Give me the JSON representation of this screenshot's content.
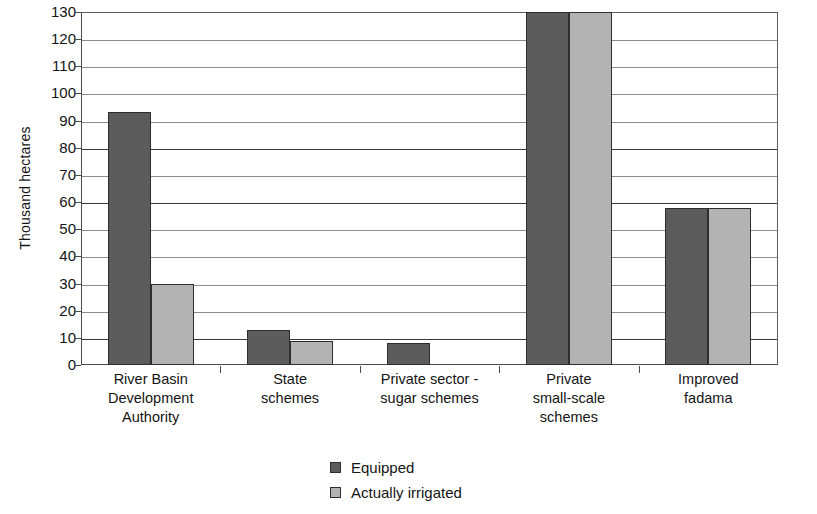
{
  "chart_data": {
    "type": "bar",
    "title": "",
    "xlabel": "",
    "ylabel": "Thousand hectares",
    "ylim": [
      0,
      130
    ],
    "ytick_step": 10,
    "yticks": [
      130,
      120,
      110,
      100,
      90,
      80,
      70,
      60,
      50,
      40,
      30,
      20,
      10,
      0
    ],
    "grid": true,
    "legend_position": "bottom-center",
    "categories": [
      "River Basin Development Authority",
      "State schemes",
      "Private sector - sugar schemes",
      "Private small-scale schemes",
      "Improved fadama"
    ],
    "category_lines": [
      [
        "River Basin",
        "Development",
        "Authority"
      ],
      [
        "State",
        "schemes"
      ],
      [
        "Private sector -",
        "sugar schemes"
      ],
      [
        "Private",
        "small-scale",
        "schemes"
      ],
      [
        "Improved",
        "fadama"
      ]
    ],
    "series": [
      {
        "name": "Equipped",
        "color": "#5c5c5c",
        "values": [
          93,
          13,
          8,
          130,
          58
        ]
      },
      {
        "name": "Actually irrigated",
        "color": "#b3b3b3",
        "values": [
          30,
          9,
          null,
          130,
          58
        ]
      }
    ]
  },
  "axis": {
    "y_title": "Thousand hectares",
    "y_tick_labels": [
      "130",
      "120",
      "110",
      "100",
      "90",
      "80",
      "70",
      "60",
      "50",
      "40",
      "30",
      "20",
      "10",
      "0"
    ]
  },
  "legend": {
    "items": [
      {
        "label": "Equipped",
        "swatch": "equipped"
      },
      {
        "label": "Actually irrigated",
        "swatch": "irrigated"
      }
    ]
  },
  "colors": {
    "equipped": "#5c5c5c",
    "actually_irrigated": "#b3b3b3",
    "axis": "#4a4a4a",
    "gridline": "#8d8d8d"
  }
}
